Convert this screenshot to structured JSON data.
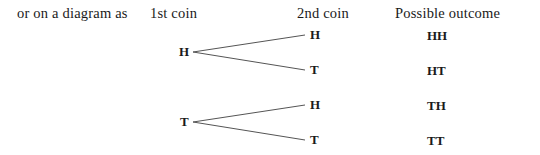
{
  "intro": "or on a diagram as",
  "headers": {
    "first_coin": "1st coin",
    "second_coin": "2nd coin",
    "outcome": "Possible outcome"
  },
  "tree": {
    "first": [
      {
        "label": "H",
        "children": [
          {
            "label": "H",
            "outcome": "HH"
          },
          {
            "label": "T",
            "outcome": "HT"
          }
        ]
      },
      {
        "label": "T",
        "children": [
          {
            "label": "H",
            "outcome": "TH"
          },
          {
            "label": "T",
            "outcome": "TT"
          }
        ]
      }
    ]
  },
  "colors": {
    "text": "#1a1a1a",
    "edge": "#555555",
    "background": "#ffffff"
  }
}
